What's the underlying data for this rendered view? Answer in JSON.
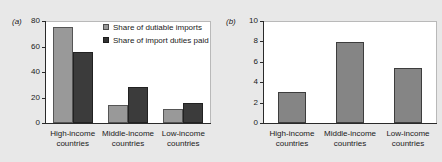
{
  "figure": {
    "background_color": "#e8e8e8",
    "plot_background_color": "#ffffff"
  },
  "colors": {
    "light_gray_bar": "#999999",
    "dark_gray_bar": "#3b3b3b",
    "solo_gray_bar": "#858585",
    "axis": "#2a2a2a",
    "text": "#1a1a1a"
  },
  "panel_a": {
    "tag": "(a)",
    "legend": [
      {
        "label": "Share of dutiable imports",
        "swatch": "light-gray-swatch-icon"
      },
      {
        "label": "Share of import duties paid",
        "swatch": "dark-gray-swatch-icon"
      }
    ]
  },
  "panel_b": {
    "tag": "(b)"
  },
  "chart_data": [
    {
      "type": "bar",
      "panel": "(a)",
      "title": "",
      "xlabel": "",
      "ylabel": "",
      "ylim": [
        0,
        80
      ],
      "yticks": [
        0,
        20,
        40,
        60,
        80
      ],
      "grid": false,
      "legend_position": "top-right inside plot",
      "categories": [
        "High-income countries",
        "Middle-income countries",
        "Low-income countries"
      ],
      "category_lines": [
        [
          "High-income",
          "countries"
        ],
        [
          "Middle-income",
          "countries"
        ],
        [
          "Low-income",
          "countries"
        ]
      ],
      "series": [
        {
          "name": "Share of dutiable imports",
          "color": "#999999",
          "values": [
            75,
            14,
            11
          ]
        },
        {
          "name": "Share of import duties paid",
          "color": "#3b3b3b",
          "values": [
            56,
            28,
            16
          ]
        }
      ]
    },
    {
      "type": "bar",
      "panel": "(b)",
      "title": "",
      "xlabel": "",
      "ylabel": "",
      "ylim": [
        0,
        10
      ],
      "yticks": [
        0,
        2,
        4,
        6,
        8,
        10
      ],
      "grid": false,
      "legend_position": "none",
      "categories": [
        "High-income countries",
        "Middle-income countries",
        "Low-income countries"
      ],
      "category_lines": [
        [
          "High-income",
          "countries"
        ],
        [
          "Middle-income",
          "countries"
        ],
        [
          "Low-income",
          "countries"
        ]
      ],
      "series": [
        {
          "name": "",
          "color": "#858585",
          "values": [
            3.0,
            7.9,
            5.4
          ]
        }
      ]
    }
  ]
}
